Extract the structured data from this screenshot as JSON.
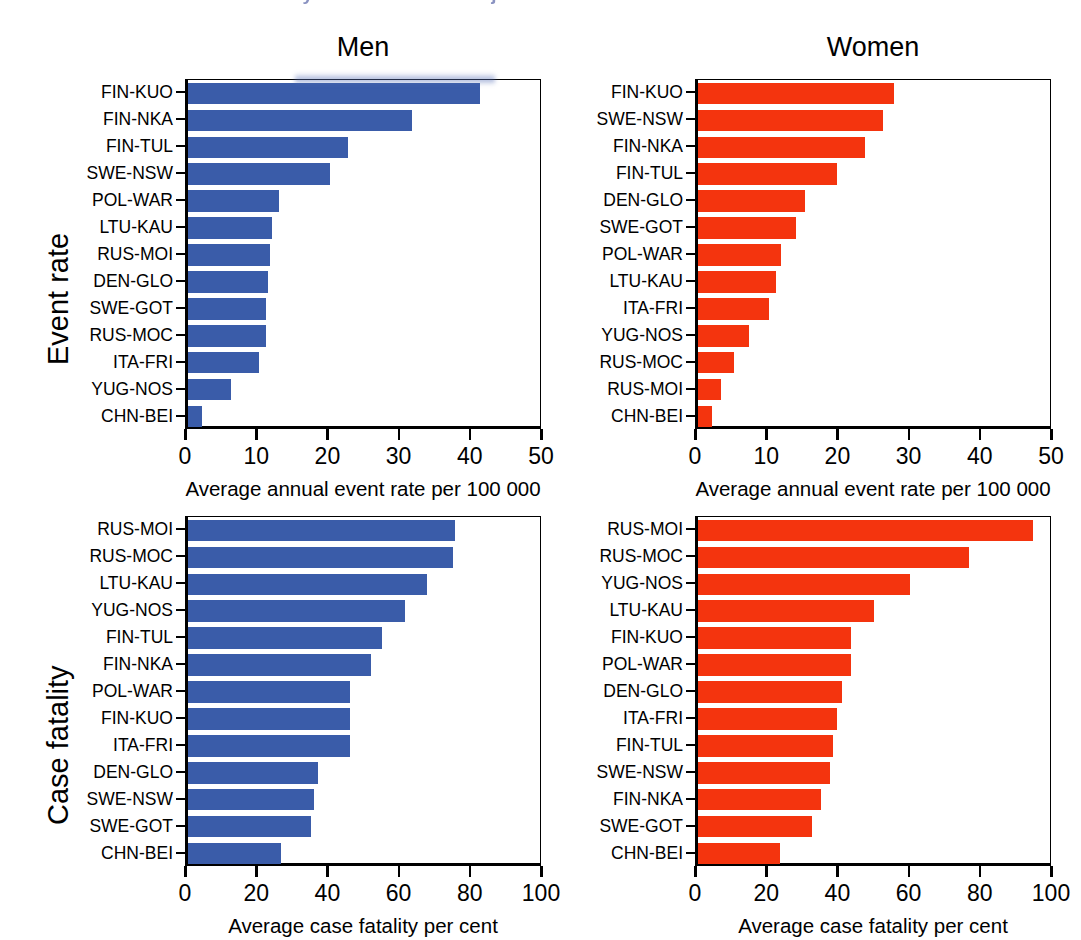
{
  "page_header": {
    "text": "230  Event rates and case fatality in the MONICA Project"
  },
  "figure": {
    "column_titles": [
      "Men",
      "Women"
    ],
    "row_titles": [
      "Event rate",
      "Case fatality"
    ]
  },
  "chart_data": [
    {
      "id": "men-event-rate",
      "type": "bar",
      "orientation": "horizontal",
      "title": "Men",
      "row_label": "Event rate",
      "xlabel": "Average annual event rate per 100 000",
      "ylabel": "",
      "xlim": [
        0,
        50
      ],
      "xticks": [
        0,
        10,
        20,
        30,
        40,
        50
      ],
      "xtick_labels": [
        "0",
        "10",
        "20",
        "30",
        "40",
        "50"
      ],
      "grid": false,
      "legend": "none",
      "color": "#3a5ca9",
      "categories": [
        "FIN-KUO",
        "FIN-NKA",
        "FIN-TUL",
        "SWE-NSW",
        "POL-WAR",
        "LTU-KAU",
        "RUS-MOI",
        "DEN-GLO",
        "SWE-GOT",
        "RUS-MOC",
        "ITA-FRI",
        "YUG-NOS",
        "CHN-BEI"
      ],
      "values": [
        41.0,
        31.5,
        22.5,
        20.0,
        12.8,
        11.8,
        11.5,
        11.2,
        11.0,
        11.0,
        10.0,
        6.0,
        2.0
      ]
    },
    {
      "id": "women-event-rate",
      "type": "bar",
      "orientation": "horizontal",
      "title": "Women",
      "row_label": "Event rate",
      "xlabel": "Average annual event rate per 100 000",
      "ylabel": "",
      "xlim": [
        0,
        50
      ],
      "xticks": [
        0,
        10,
        20,
        30,
        40,
        50
      ],
      "xtick_labels": [
        "0",
        "10",
        "20",
        "30",
        "40",
        "50"
      ],
      "grid": false,
      "legend": "none",
      "color": "#f4340e",
      "categories": [
        "FIN-KUO",
        "SWE-NSW",
        "FIN-NKA",
        "FIN-TUL",
        "DEN-GLO",
        "SWE-GOT",
        "POL-WAR",
        "LTU-KAU",
        "ITA-FRI",
        "YUG-NOS",
        "RUS-MOC",
        "RUS-MOI",
        "CHN-BEI"
      ],
      "values": [
        27.5,
        26.0,
        23.5,
        19.5,
        15.0,
        13.8,
        11.7,
        11.0,
        10.0,
        7.2,
        5.0,
        3.2,
        2.0
      ]
    },
    {
      "id": "men-case-fatality",
      "type": "bar",
      "orientation": "horizontal",
      "title": "Men",
      "row_label": "Case fatality",
      "xlabel": "Average case fatality per cent",
      "ylabel": "",
      "xlim": [
        0,
        100
      ],
      "xticks": [
        0,
        20,
        40,
        60,
        80,
        100
      ],
      "xtick_labels": [
        "0",
        "20",
        "40",
        "60",
        "80",
        "100"
      ],
      "grid": false,
      "legend": "none",
      "color": "#3a5ca9",
      "categories": [
        "RUS-MOI",
        "RUS-MOC",
        "LTU-KAU",
        "YUG-NOS",
        "FIN-TUL",
        "FIN-NKA",
        "POL-WAR",
        "FIN-KUO",
        "ITA-FRI",
        "DEN-GLO",
        "SWE-NSW",
        "SWE-GOT",
        "CHN-BEI"
      ],
      "values": [
        75.0,
        74.5,
        67.0,
        61.0,
        54.5,
        51.5,
        45.5,
        45.5,
        45.5,
        36.5,
        35.5,
        34.5,
        26.0
      ]
    },
    {
      "id": "women-case-fatality",
      "type": "bar",
      "orientation": "horizontal",
      "title": "Women",
      "row_label": "Case fatality",
      "xlabel": "Average case fatality per cent",
      "ylabel": "",
      "xlim": [
        0,
        100
      ],
      "xticks": [
        0,
        20,
        40,
        60,
        80,
        100
      ],
      "xtick_labels": [
        "0",
        "20",
        "40",
        "60",
        "80",
        "100"
      ],
      "grid": false,
      "legend": "none",
      "color": "#f4340e",
      "categories": [
        "RUS-MOI",
        "RUS-MOC",
        "YUG-NOS",
        "LTU-KAU",
        "FIN-KUO",
        "POL-WAR",
        "DEN-GLO",
        "ITA-FRI",
        "FIN-TUL",
        "SWE-NSW",
        "FIN-NKA",
        "SWE-GOT",
        "CHN-BEI"
      ],
      "values": [
        94.0,
        76.0,
        59.5,
        49.5,
        43.0,
        43.0,
        40.5,
        39.0,
        38.0,
        37.0,
        34.5,
        32.0,
        23.0
      ]
    }
  ]
}
